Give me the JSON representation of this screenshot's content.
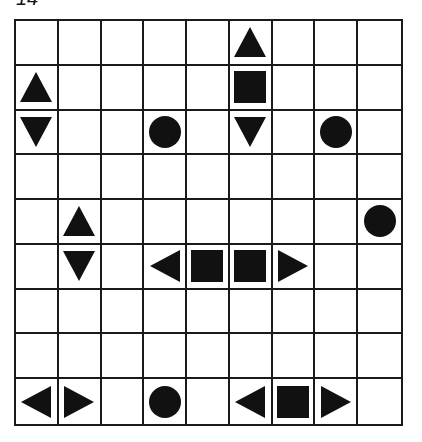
{
  "puzzle": {
    "label": "14",
    "rows": 9,
    "cols": 9,
    "colors": {
      "ink": "#111111",
      "background": "#ffffff",
      "grid": "#1a1a1a"
    },
    "cells": [
      [
        "empty",
        "empty",
        "empty",
        "empty",
        "empty",
        "top",
        "empty",
        "empty",
        "empty"
      ],
      [
        "top",
        "empty",
        "empty",
        "empty",
        "empty",
        "middle",
        "empty",
        "empty",
        "empty"
      ],
      [
        "bottom",
        "empty",
        "empty",
        "sub",
        "empty",
        "bottom",
        "empty",
        "sub",
        "empty"
      ],
      [
        "empty",
        "empty",
        "empty",
        "empty",
        "empty",
        "empty",
        "empty",
        "empty",
        "empty"
      ],
      [
        "empty",
        "top",
        "empty",
        "empty",
        "empty",
        "empty",
        "empty",
        "empty",
        "sub"
      ],
      [
        "empty",
        "bottom",
        "empty",
        "left",
        "middle",
        "middle",
        "right",
        "empty",
        "empty"
      ],
      [
        "empty",
        "empty",
        "empty",
        "empty",
        "empty",
        "empty",
        "empty",
        "empty",
        "empty"
      ],
      [
        "empty",
        "empty",
        "empty",
        "empty",
        "empty",
        "empty",
        "empty",
        "empty",
        "empty"
      ],
      [
        "left",
        "right",
        "empty",
        "sub",
        "empty",
        "left",
        "middle",
        "right",
        "empty"
      ]
    ],
    "piece_icons": {
      "top": "triangle-up-icon",
      "bottom": "triangle-down-icon",
      "left": "triangle-left-icon",
      "right": "triangle-right-icon",
      "middle": "square-icon",
      "sub": "circle-icon"
    }
  }
}
